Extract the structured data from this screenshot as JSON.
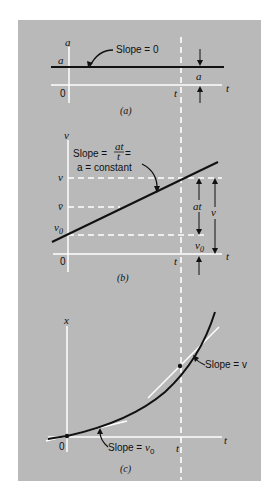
{
  "figure": {
    "background_color": "#b9b9b9",
    "axis_color": "#ffffff",
    "curve_color": "#111111",
    "shared_marker": {
      "label": "t",
      "style": "dashed-vertical-white"
    }
  },
  "panel_a": {
    "caption": "(a)",
    "y_axis_label": "a",
    "x_axis_label": "t",
    "origin_label": "0",
    "level_label": "a",
    "t_tick_label": "t",
    "annotation": "Slope = 0",
    "dimension_label": "a"
  },
  "panel_b": {
    "caption": "(b)",
    "y_axis_label": "v",
    "x_axis_label": "t",
    "origin_label": "0",
    "t_tick_label": "t",
    "v_label": "v",
    "vbar_label": "v̄",
    "v0_label": "v",
    "v0_sub": "0",
    "annotation_line1_prefix": "Slope = ",
    "annotation_frac_num": "at",
    "annotation_frac_den": "t",
    "annotation_line1_suffix": " =",
    "annotation_line2": "a = constant",
    "dim_at_label": "at",
    "dim_v_label": "v",
    "dim_v0_label": "v",
    "dim_v0_sub": "0"
  },
  "panel_c": {
    "caption": "(c)",
    "y_axis_label": "x",
    "x_axis_label": "t",
    "origin_label": "0",
    "t_tick_label": "t",
    "annotation_t": "Slope = v",
    "annotation_0_prefix": "Slope = ",
    "annotation_0_var": "v",
    "annotation_0_sub": "0"
  }
}
